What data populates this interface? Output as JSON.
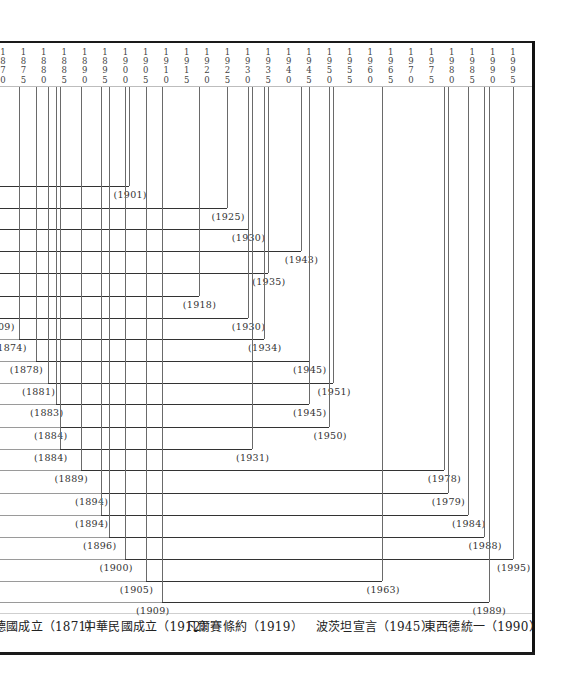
{
  "chart_data": {
    "type": "timeline",
    "title": "",
    "x_axis": {
      "ticks": [
        1870,
        1875,
        1880,
        1885,
        1890,
        1895,
        1900,
        1905,
        1910,
        1915,
        1920,
        1925,
        1930,
        1935,
        1940,
        1945,
        1950,
        1955,
        1960,
        1965,
        1970,
        1975,
        1980,
        1985,
        1990,
        1995
      ],
      "range": [
        1870,
        1995
      ]
    },
    "rows": [
      {
        "start_label": "",
        "end": 1901
      },
      {
        "start_label": "",
        "end": 1925
      },
      {
        "start_label": "",
        "end": 1930
      },
      {
        "start_label": "",
        "end": 1943
      },
      {
        "start_label": "",
        "end": 1935
      },
      {
        "start_label": "",
        "end": 1918
      },
      {
        "start_label": "…69)",
        "end": 1930
      },
      {
        "start_label": "(1874)",
        "start": 1874,
        "end": 1934
      },
      {
        "start_label": "(1878)",
        "start": 1878,
        "end": 1945
      },
      {
        "start_label": "(1881)",
        "start": 1881,
        "end": 1951
      },
      {
        "start_label": "(1883)",
        "start": 1883,
        "end": 1945
      },
      {
        "start_label": "(1884)",
        "start": 1884,
        "end": 1950
      },
      {
        "start_label": "(1884)",
        "start": 1884,
        "end": 1931
      },
      {
        "start_label": "(1889)",
        "start": 1889,
        "end": 1978
      },
      {
        "start_label": "(1894)",
        "start": 1894,
        "end": 1979
      },
      {
        "start_label": "(1894)",
        "start": 1894,
        "end": 1984
      },
      {
        "start_label": "(1896)",
        "start": 1896,
        "end": 1988
      },
      {
        "start_label": "(1900)",
        "start": 1900,
        "end": 1995
      },
      {
        "start_label": "(1905)",
        "start": 1905,
        "end": 1963
      },
      {
        "start_label": "(1909)",
        "start": 1909,
        "end": 1989
      }
    ],
    "events": [
      {
        "label": "…國成立",
        "year": 1871
      },
      {
        "label": "中華民國成立",
        "year": 1912
      },
      {
        "label": "凡爾賽條約",
        "year": 1919
      },
      {
        "label": "波茨坦宣言",
        "year": 1945
      },
      {
        "label": "東西德統一",
        "year": 1990
      }
    ]
  },
  "header": {
    "tick_labels": [
      "1\n8\n7\n0",
      "1\n8\n7\n5",
      "1\n8\n8\n0",
      "1\n8\n8\n5",
      "1\n8\n9\n0",
      "1\n8\n9\n5",
      "1\n9\n0\n0",
      "1\n9\n0\n5",
      "1\n9\n1\n0",
      "1\n9\n1\n5",
      "1\n9\n2\n0",
      "1\n9\n2\n5",
      "1\n9\n3\n0",
      "1\n9\n3\n5",
      "1\n9\n4\n0",
      "1\n9\n4\n5",
      "1\n9\n5\n0",
      "1\n9\n5\n5",
      "1\n9\n6\n0",
      "1\n9\n6\n5",
      "1\n9\n7\n0",
      "1\n9\n7\n5",
      "1\n9\n8\n0",
      "1\n9\n8\n5",
      "1\n9\n9\n0",
      "1\n9\n9\n5"
    ]
  },
  "rows": {
    "end_labels": [
      "(1901)",
      "(1925)",
      "(1930)",
      "(1943)",
      "(1935)",
      "(1918)",
      "(1930)",
      "(1934)",
      "(1945)",
      "(1951)",
      "(1945)",
      "(1950)",
      "(1931)",
      "(1978)",
      "(1979)",
      "(1984)",
      "(1988)",
      "(1995)",
      "(1963)",
      "(1989)"
    ],
    "start_labels": [
      "",
      "",
      "",
      "",
      "",
      "",
      "09)",
      "(1874)",
      "(1878)",
      "(1881)",
      "(1883)",
      "(1884)",
      "(1884)",
      "(1889)",
      "(1894)",
      "(1894)",
      "(1896)",
      "(1900)",
      "(1905)",
      "(1909)"
    ]
  },
  "footer": {
    "events": [
      "德國成立（1871）",
      "中華民國成立（1912）",
      "凡爾賽條約（1919）",
      "波茨坦宣言（1945）",
      "東西德統一（1990）"
    ]
  },
  "colors": {
    "frame": "#1a1a1a",
    "line": "#333333",
    "text": "#222222"
  }
}
